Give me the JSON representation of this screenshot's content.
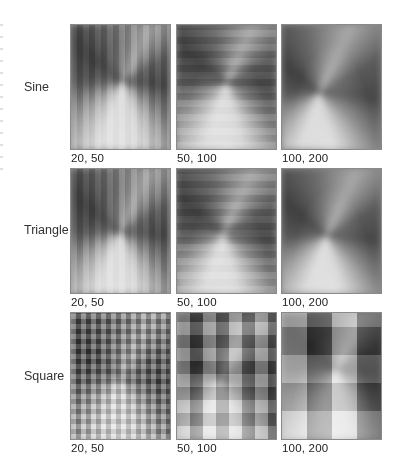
{
  "figure": {
    "rows": [
      {
        "label": "Sine",
        "panels": [
          {
            "caption": "20, 50",
            "pattern": "sine-vortex-fine"
          },
          {
            "caption": "50, 100",
            "pattern": "sine-vortex-medium"
          },
          {
            "caption": "100, 200",
            "pattern": "sine-vortex-smooth"
          }
        ]
      },
      {
        "label": "Triangle",
        "panels": [
          {
            "caption": "20, 50",
            "pattern": "triangle-vortex-fine"
          },
          {
            "caption": "50, 100",
            "pattern": "triangle-vortex-medium"
          },
          {
            "caption": "100, 200",
            "pattern": "triangle-vortex-smooth"
          }
        ]
      },
      {
        "label": "Square",
        "panels": [
          {
            "caption": "20, 50",
            "pattern": "square-checker-fine"
          },
          {
            "caption": "50, 100",
            "pattern": "square-checker-medium"
          },
          {
            "caption": "100, 200",
            "pattern": "square-checker-large"
          }
        ]
      }
    ]
  }
}
